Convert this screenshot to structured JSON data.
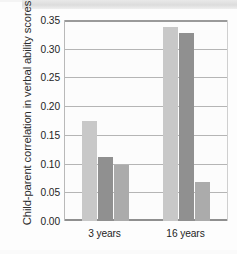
{
  "chart_data": {
    "type": "bar",
    "title": "",
    "subtitle": "",
    "xlabel": "",
    "ylabel": "Child-parent correlation in verbal ability scores",
    "categories": [
      "3 years",
      "16 years"
    ],
    "series": [
      {
        "name": "series-1",
        "color": "#c8c8c8",
        "values": [
          0.175,
          0.338
        ]
      },
      {
        "name": "series-2",
        "color": "#909090",
        "values": [
          0.112,
          0.328
        ]
      },
      {
        "name": "series-3",
        "color": "#ababab",
        "values": [
          0.097,
          0.068
        ]
      }
    ],
    "ylim": [
      0.0,
      0.35
    ],
    "ytick_labels": [
      "0.35",
      "0.30",
      "0.25",
      "0.20",
      "0.15",
      "0.10",
      "0.05",
      "0.00"
    ],
    "ytick_values": [
      0.35,
      0.3,
      0.25,
      0.2,
      0.15,
      0.1,
      0.05,
      0.0
    ],
    "grid": true,
    "grid_axis": "y",
    "legend": false,
    "legend_position": "none"
  },
  "colors": {
    "grid": "#b5b5b5",
    "axis": "#8f8f8f",
    "text": "#242424",
    "plot_background": "#fcfcfc"
  }
}
